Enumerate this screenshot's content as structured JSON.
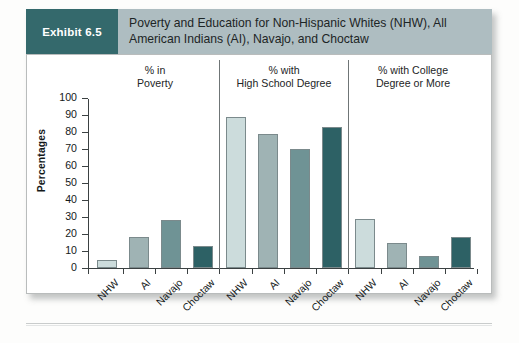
{
  "exhibit": {
    "tag": "Exhibit 6.5",
    "title": "Poverty and Education for Non-Hispanic Whites (NHW), All American Indians (AI), Navajo, and Choctaw"
  },
  "colors": {
    "tag_bg": "#34696c",
    "header_bg": "#aebdc1",
    "bar1": "#ccdcdc",
    "bar2": "#9fb3b4",
    "bar3": "#6f9395",
    "bar4": "#2d6165",
    "axis": "#3b4142"
  },
  "chart_data": {
    "type": "bar",
    "title": "Poverty and Education for Non-Hispanic Whites (NHW), All American Indians (AI), Navajo, and Choctaw",
    "xlabel": "",
    "ylabel": "Percentages",
    "ylim": [
      0,
      100
    ],
    "ytick_values": [
      0,
      10,
      20,
      30,
      40,
      50,
      60,
      70,
      80,
      90,
      100
    ],
    "grid": false,
    "legend": "none",
    "categories": [
      "NHW",
      "AI",
      "Navajo",
      "Choctaw"
    ],
    "panels": [
      {
        "caption_line1": "% in",
        "caption_line2": "Poverty",
        "values": [
          5,
          18,
          28,
          13
        ]
      },
      {
        "caption_line1": "% with",
        "caption_line2": "High School Degree",
        "values": [
          89,
          79,
          70,
          83
        ]
      },
      {
        "caption_line1": "% with College",
        "caption_line2": "Degree or More",
        "values": [
          29,
          15,
          7,
          18
        ]
      }
    ]
  }
}
